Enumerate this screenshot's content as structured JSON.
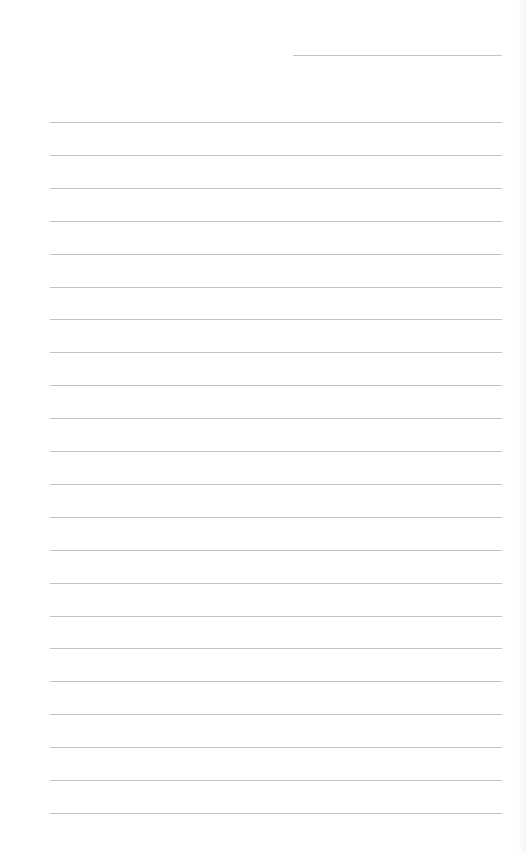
{
  "page": {
    "type": "blank lined writing sheet",
    "background_color": "#ffffff",
    "line_color": "#c2c2c2"
  },
  "header_line": {
    "label": "",
    "value": "",
    "left": 293,
    "top": 55,
    "width": 209
  },
  "ruled_lines": {
    "count": 22,
    "left": 50,
    "width": 452,
    "first_top": 122,
    "spacing": 32.9,
    "entries": [
      "",
      "",
      "",
      "",
      "",
      "",
      "",
      "",
      "",
      "",
      "",
      "",
      "",
      "",
      "",
      "",
      "",
      "",
      "",
      "",
      "",
      ""
    ]
  }
}
